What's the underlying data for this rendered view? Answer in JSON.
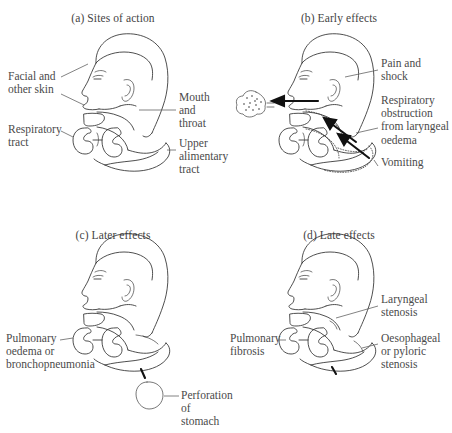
{
  "figure": {
    "background_color": "#ffffff",
    "ink_color": "#2f2f2f",
    "text_color": "#4a4a4a"
  },
  "panels": [
    {
      "id": "a",
      "title": "(a)  Sites of action",
      "labels": [
        {
          "name": "facial-and-other-skin",
          "text": "Facial and\nother skin",
          "side": "left"
        },
        {
          "name": "respiratory-tract",
          "text": "Respiratory\ntract",
          "side": "left"
        },
        {
          "name": "mouth-and-throat",
          "text": "Mouth and\nthroat",
          "side": "right"
        },
        {
          "name": "upper-alimentary-tract",
          "text": "Upper\nalimentary\ntract",
          "side": "right"
        }
      ]
    },
    {
      "id": "b",
      "title": "(b)  Early effects",
      "labels": [
        {
          "name": "pain-and-shock",
          "text": "Pain and\nshock",
          "side": "right"
        },
        {
          "name": "respiratory-obstruction",
          "text": "Respiratory\nobstruction\nfrom laryngeal\noedema",
          "side": "right"
        },
        {
          "name": "vomiting",
          "text": "Vomiting",
          "side": "right"
        }
      ]
    },
    {
      "id": "c",
      "title": "(c)  Later effects",
      "labels": [
        {
          "name": "pulmonary-oedema-or-bronchopneumonia",
          "text": "Pulmonary\noedema or\nbronchopneumonia",
          "side": "left"
        },
        {
          "name": "perforation-of-stomach",
          "text": "Perforation of\nstomach",
          "side": "right"
        }
      ]
    },
    {
      "id": "d",
      "title": "(d)  Late effects",
      "labels": [
        {
          "name": "pulmonary-fibrosis",
          "text": "Pulmonary\nfibrosis",
          "side": "left"
        },
        {
          "name": "laryngeal-stenosis",
          "text": "Laryngeal\nstenosis",
          "side": "right"
        },
        {
          "name": "oesophageal-or-pyloric-stenosis",
          "text": "Oesophageal\nor pyloric\nstenosis",
          "side": "right"
        }
      ]
    }
  ]
}
